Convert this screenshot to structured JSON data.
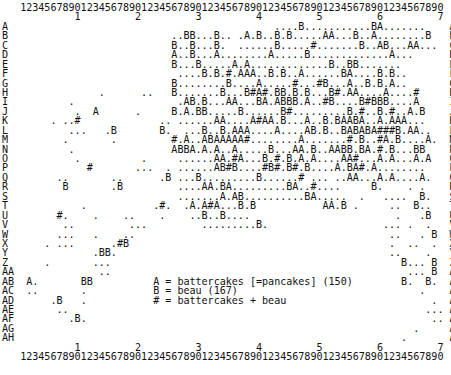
{
  "ruler": {
    "digits": "1234567890123456789012345678901234567890123456789012345678901234567890",
    "tens": "         1         2         3         4         5         6         7"
  },
  "rows": [
    {
      "label": "A",
      "content": "                                          ....B...........BA.......  "
    },
    {
      "label": "B",
      "content": "                         ..BB...B.. .A.B..B.B.....AA...B..A........B "
    },
    {
      "label": "C",
      "content": "                         B..B...B.  ......B.....#.......B..AB...AA...  "
    },
    {
      "label": "D",
      "content": "                         A..B...A........A.....B.............A...    "
    },
    {
      "label": "E",
      "content": "                         B...B.....A.A.............B..BB.......      "
    },
    {
      "label": "F",
      "content": "                          ....B.B.#.AAA..B.B..A......BA....B.B..     "
    },
    {
      "label": "G",
      "content": "                         B........B....A.....#...#B...A..B.B.A..     "
    },
    {
      "label": "H",
      "content": "             .      ..   B.......B...B#A#.BB.B.B...B#.AA....A....#   "
    },
    {
      "label": "I",
      "content": "        .                 .AB.B...AA...BA.ABBB.A..#B....B#BBB....A   "
    },
    {
      "label": "J",
      "content": "         .  A      .     B.A.BB.....B......B#.........B.#..B.#..A.B  "
    },
    {
      "label": "K",
      "content": "     . ..#             .. ......AA....A#AA.B...A..B.BAABA..A.AAA...  "
    },
    {
      "label": "L",
      "content": "        ...   .B       B.  ...B..B.AAA....A....AB.B..BABABA###B.AA.. "
    },
    {
      "label": "M",
      "content": "       .       .         #.A..ABAAAAA#........A.......#.B..#A.B....A."
    },
    {
      "label": "N",
      "content": "        .                ABBA.A.A..A.....B...AA.B..AABB.BA.#.B...BB"
    },
    {
      "label": "O",
      "content": "         .          .     ......AA.#A...B.#.B.A.A....AA#...A.A...A.A"
    },
    {
      "label": "P",
      "content": "           #       ...  . ......AB#B....#B#.B#.B....A.BA#.A........ "
    },
    {
      "label": "Q",
      "content": "      ..       ..      .B ...B.........B......# ... ..AA...A.A....A. "
    },
    {
      "label": "R",
      "content": "       B       .B         ....AA.BA.........BA..#....     B.    . .  "
    },
    {
      "label": "S",
      "content": "                          .......A.AB..........BA.....  .   ....  B. "
    },
    {
      "label": "T",
      "content": "          .           .#.  .A.A#A...B.B           AA.B .     ..  B.. "
    },
    {
      "label": "U",
      "content": "      #.    .    ..    .    ..B..B....                        .   .B "
    },
    {
      "label": "V",
      "content": "       ..         ...         .........B.                   ... .  . "
    },
    {
      "label": "W",
      "content": "      ...   .    ..                                          ..   . B"
    },
    {
      "label": "X",
      "content": "    . ...      .#B                                           .  ..  ."
    },
    {
      "label": "Y",
      "content": "            .BB.                                             ..    . "
    },
    {
      "label": "Z",
      "content": "    .       ...                                                B... B ."
    },
    {
      "label": "AA",
      "content": "             ..                                                 ... B "
    },
    {
      "label": "AB",
      "content": " A.       BB          A = battercakes [=pancakes] (150)        B.  B. ."
    },
    {
      "label": "AC",
      "content": " ..       .           B = beau (167)                              .   . ."
    },
    {
      "label": "AD",
      "content": "     .B   .           # = battercakes + beau                        .  . ."
    },
    {
      "label": "AE",
      "content": "      ..                                                           ...."
    },
    {
      "label": "AF",
      "content": "        .B.                                                         ..."
    },
    {
      "label": "AG",
      "content": "                                                                 .     "
    },
    {
      "label": "AH",
      "content": "                                                               .       "
    }
  ],
  "legend": {
    "A": "A = battercakes [=pancakes] (150)",
    "B": "B = beau (167)",
    "both": "# = battercakes + beau"
  }
}
